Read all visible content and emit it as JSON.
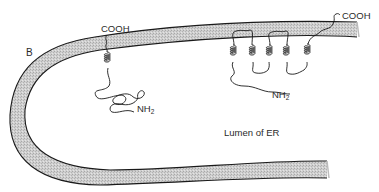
{
  "figure": {
    "panel_label": "B",
    "membrane_fill": "#c9c9c9",
    "membrane_outline": "#1a1a1a",
    "region_label": "Lumen of ER"
  },
  "proteins": [
    {
      "name": "single-pass protein",
      "cytosolic_terminus": "COOH",
      "lumenal_terminus": "NH",
      "lumenal_terminus_subscript": "2",
      "transmembrane_helices": 1
    },
    {
      "name": "multi-pass protein",
      "cytosolic_terminus": "COOH",
      "lumenal_terminus": "NH",
      "lumenal_terminus_subscript": "2",
      "transmembrane_helices": 5
    }
  ]
}
